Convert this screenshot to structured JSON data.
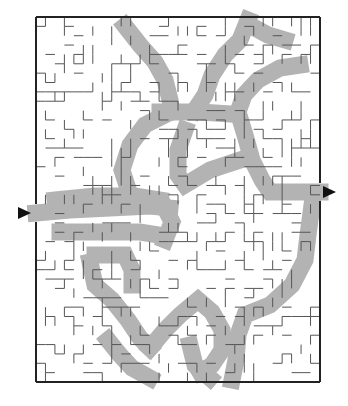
{
  "puzzle": {
    "type": "maze",
    "frame": {
      "x": 36,
      "y": 17,
      "width": 284,
      "height": 365
    },
    "colors": {
      "background": "#ffffff",
      "wall": "#555555",
      "border": "#222222",
      "solution": "#b3b3b3",
      "arrow": "#111111"
    },
    "entrance_arrow": {
      "direction": "right",
      "x": 18,
      "y": 213
    },
    "exit_arrow": {
      "direction": "right",
      "x": 323,
      "y": 192
    },
    "entrance_gap": {
      "side": "left",
      "y1": 204,
      "y2": 222
    },
    "exit_gap": {
      "side": "right",
      "y1": 183,
      "y2": 201
    },
    "grid": {
      "cols": 30,
      "rows": 39,
      "cell": 9.4
    },
    "solution_paths": [
      [
        [
          36,
          213
        ],
        [
          70,
          210
        ],
        [
          110,
          208
        ],
        [
          150,
          206
        ],
        [
          170,
          208
        ]
      ],
      [
        [
          55,
          200
        ],
        [
          95,
          196
        ],
        [
          135,
          196
        ],
        [
          160,
          200
        ]
      ],
      [
        [
          125,
          26
        ],
        [
          140,
          45
        ],
        [
          155,
          62
        ],
        [
          165,
          80
        ],
        [
          170,
          100
        ],
        [
          172,
          112
        ]
      ],
      [
        [
          248,
          20
        ],
        [
          240,
          40
        ],
        [
          225,
          55
        ],
        [
          212,
          75
        ],
        [
          205,
          95
        ],
        [
          195,
          110
        ]
      ],
      [
        [
          160,
          112
        ],
        [
          200,
          112
        ],
        [
          230,
          114
        ]
      ],
      [
        [
          165,
          115
        ],
        [
          145,
          125
        ],
        [
          130,
          145
        ],
        [
          122,
          170
        ],
        [
          130,
          195
        ]
      ],
      [
        [
          300,
          65
        ],
        [
          280,
          68
        ],
        [
          258,
          80
        ],
        [
          244,
          95
        ],
        [
          238,
          112
        ],
        [
          245,
          135
        ],
        [
          252,
          160
        ],
        [
          262,
          180
        ],
        [
          270,
          192
        ],
        [
          320,
          192
        ]
      ],
      [
        [
          185,
          130
        ],
        [
          178,
          150
        ],
        [
          178,
          175
        ],
        [
          185,
          185
        ],
        [
          210,
          170
        ],
        [
          240,
          160
        ]
      ],
      [
        [
          60,
          232
        ],
        [
          100,
          232
        ],
        [
          140,
          232
        ],
        [
          165,
          236
        ]
      ],
      [
        [
          165,
          208
        ],
        [
          172,
          222
        ],
        [
          165,
          240
        ]
      ],
      [
        [
          95,
          255
        ],
        [
          125,
          255
        ],
        [
          132,
          270
        ],
        [
          132,
          285
        ]
      ],
      [
        [
          90,
          262
        ],
        [
          95,
          285
        ],
        [
          112,
          300
        ],
        [
          128,
          320
        ],
        [
          140,
          338
        ],
        [
          150,
          348
        ]
      ],
      [
        [
          150,
          348
        ],
        [
          165,
          330
        ],
        [
          180,
          315
        ],
        [
          198,
          300
        ],
        [
          212,
          312
        ],
        [
          222,
          330
        ],
        [
          222,
          350
        ],
        [
          212,
          365
        ],
        [
          200,
          372
        ]
      ],
      [
        [
          312,
          205
        ],
        [
          308,
          235
        ],
        [
          305,
          260
        ],
        [
          292,
          285
        ],
        [
          270,
          305
        ],
        [
          245,
          315
        ],
        [
          238,
          335
        ],
        [
          236,
          360
        ],
        [
          232,
          380
        ]
      ],
      [
        [
          108,
          340
        ],
        [
          120,
          355
        ],
        [
          132,
          368
        ],
        [
          150,
          378
        ]
      ],
      [
        [
          190,
          345
        ],
        [
          195,
          365
        ],
        [
          210,
          378
        ]
      ],
      [
        [
          255,
          28
        ],
        [
          268,
          35
        ],
        [
          285,
          40
        ]
      ]
    ],
    "wall_seed": 7,
    "wall_density": 0.55
  }
}
